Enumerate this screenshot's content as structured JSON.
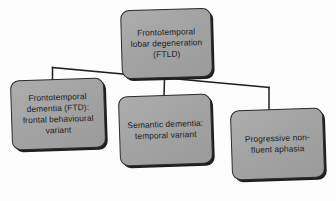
{
  "diagram": {
    "type": "hierarchy-flowchart",
    "orientation": "top-down",
    "background_color": "#fdfdfd",
    "node_fill_color": "#a5a5a5",
    "node_border_color": "#2b2b2b",
    "node_text_color": "#1c1c1c",
    "connector_color": "#1f1f1f",
    "root": {
      "id": "ftld",
      "label": "Frontotemporal lobar degeneration (FTLD)",
      "line1": "Frontotemporal",
      "line2": "lobar degeneration",
      "line3": "(FTLD)",
      "abbreviation": "FTLD"
    },
    "children": [
      {
        "id": "ftd",
        "label": "Frontotemporal dementia (FTD): frontal behavioural variant",
        "line1": "Frontotemporal",
        "line2": "dementia (FTD):",
        "line3": "frontal behavioural",
        "line4": "variant",
        "abbreviation": "FTD"
      },
      {
        "id": "sd",
        "label": "Semantic dementia: temporal variant",
        "line1": "Semantic dementia:",
        "line2": "temporal variant",
        "line3": "",
        "line4": "",
        "abbreviation": "SD"
      },
      {
        "id": "pnfa",
        "label": "Progressive non-fluent aphasia",
        "line1": "Progressive non-",
        "line2": "fluent aphasia",
        "line3": "",
        "line4": "",
        "abbreviation": "PNFA"
      }
    ],
    "connectors": [
      {
        "from": "ftld",
        "to": "ftd",
        "style": "elbow"
      },
      {
        "from": "ftld",
        "to": "sd",
        "style": "straight"
      },
      {
        "from": "ftld",
        "to": "pnfa",
        "style": "elbow"
      }
    ]
  }
}
